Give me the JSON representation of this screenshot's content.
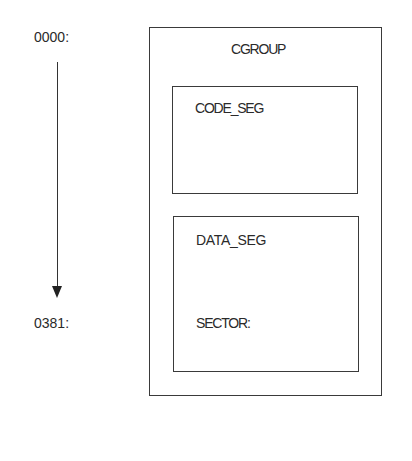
{
  "address_axis": {
    "start_label": "0000:",
    "end_label": "0381:",
    "direction": "down"
  },
  "group": {
    "title": "CGROUP",
    "segments": [
      {
        "name": "CODE_SEG",
        "contents": []
      },
      {
        "name": "DATA_SEG",
        "contents": [
          "SECTOR:"
        ]
      }
    ]
  }
}
